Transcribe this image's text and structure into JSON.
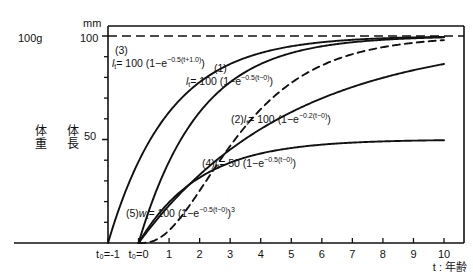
{
  "chart_data": {
    "type": "line",
    "title": "",
    "xlabel": "t : 年齢",
    "ylabel_left_weight": "体重",
    "ylabel_left_length": "体長",
    "unit_length": "mm",
    "unit_weight": "100g",
    "xlim": [
      -1,
      10
    ],
    "ylim": [
      0,
      107
    ],
    "grid": false,
    "legend": "inline-annotations",
    "y_ticks_major": [
      50,
      100
    ],
    "y_ticks_minor": [
      10,
      20,
      30,
      40,
      60,
      70,
      80,
      90
    ],
    "x_ticks": [
      "t₀=-1",
      "t₀=0",
      "1",
      "2",
      "3",
      "4",
      "5",
      "6",
      "7",
      "8",
      "9",
      "10"
    ],
    "x_tick_values": [
      -1,
      0,
      1,
      2,
      3,
      4,
      5,
      6,
      7,
      8,
      9,
      10
    ],
    "asymptote": {
      "y": 100,
      "style": "dashed",
      "label": "100"
    },
    "series": [
      {
        "id": "3",
        "number": "(3)",
        "equation_text": "l t = 100 (1−e^−0.5(t+1.0))",
        "style": "solid",
        "t_start": -1,
        "asymptote": 100,
        "rate": 0.5,
        "offset": 1.0,
        "exponent": 1,
        "values": [
          0,
          39.3,
          63.2,
          77.7,
          86.5,
          91.8,
          95.0,
          96.9,
          98.2,
          98.9,
          99.3,
          99.6
        ]
      },
      {
        "id": "1",
        "number": "(1)",
        "equation_text": "l t = 100 (1−e^−0.5(t−0))",
        "style": "solid",
        "t_start": 0,
        "asymptote": 100,
        "rate": 0.5,
        "offset": 0,
        "exponent": 1,
        "values": [
          0,
          39.3,
          63.2,
          77.7,
          86.5,
          91.8,
          95.0,
          96.9,
          98.2,
          98.9,
          99.3
        ]
      },
      {
        "id": "2",
        "number": "(2)",
        "equation_text": "l t = 100 (1−e^−0.2(t−0))",
        "style": "solid",
        "t_start": 0,
        "asymptote": 100,
        "rate": 0.2,
        "offset": 0,
        "exponent": 1,
        "values": [
          0,
          18.1,
          33.0,
          45.1,
          55.1,
          63.2,
          69.9,
          75.3,
          79.8,
          83.5,
          86.5
        ]
      },
      {
        "id": "4",
        "number": "(4)",
        "equation_text": "l t = 50 (1−e^−0.5(t−0))",
        "style": "solid",
        "t_start": 0,
        "asymptote": 50,
        "rate": 0.5,
        "offset": 0,
        "exponent": 1,
        "values": [
          0,
          19.7,
          31.6,
          38.8,
          43.2,
          45.9,
          47.5,
          48.4,
          49.1,
          49.4,
          49.7
        ]
      },
      {
        "id": "5",
        "number": "(5)",
        "equation_text": "w t = 100 (1−e^−0.5(t−0))³",
        "style": "dashed",
        "t_start": 0,
        "asymptote": 100,
        "rate": 0.5,
        "offset": 0,
        "exponent": 3,
        "values": [
          0,
          6.1,
          25.3,
          46.9,
          64.8,
          77.3,
          85.8,
          91.0,
          94.6,
          96.8,
          98.1
        ]
      }
    ]
  },
  "axes": {
    "y_label_100": "100",
    "y_label_50": "50",
    "y_unit_mm": "mm",
    "y_unit_100g": "100g",
    "weight_char_1": "体",
    "weight_char_2": "重",
    "length_char_1": "体",
    "length_char_2": "長",
    "x_title": "t : 年齢",
    "x_t_minus1": "t₀=-1",
    "x_t_zero": "t₀=0",
    "x_1": "1",
    "x_2": "2",
    "x_3": "3",
    "x_4": "4",
    "x_5": "5",
    "x_6": "6",
    "x_7": "7",
    "x_8": "8",
    "x_9": "9",
    "x_10": "10"
  },
  "annotations": {
    "eq3_number": "(3)",
    "eq3_lhs": "l",
    "eq3_sub": "t",
    "eq3_rest": "= 100 (1−e",
    "eq3_exp": "−0.5(t+1.0)",
    "eq3_tail": ")",
    "eq1_number": "(1)",
    "eq1_lhs": "l",
    "eq1_sub": "t",
    "eq1_rest": "= 100 (1−e",
    "eq1_exp": "−0.5(t−0)",
    "eq1_tail": ")",
    "eq2_number": "(2)",
    "eq2_lhs": "l",
    "eq2_sub": "t",
    "eq2_rest": "= 100 (1−e",
    "eq2_exp": "−0.2(t−0)",
    "eq2_tail": ")",
    "eq4_number": "(4)",
    "eq4_lhs": "l",
    "eq4_sub": "t",
    "eq4_rest": "= 50 (1−e",
    "eq4_exp": "−0.5(t−0)",
    "eq4_tail": ")",
    "eq5_number": "(5)",
    "eq5_lhs": "w",
    "eq5_sub": "t",
    "eq5_rest": "= 100 (1−e",
    "eq5_exp": "−0.5(t−0)",
    "eq5_tail": ")",
    "eq5_power": "3"
  },
  "colors": {
    "ink": "#111111",
    "background": "#ffffff"
  }
}
